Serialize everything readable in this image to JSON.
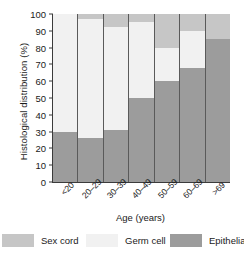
{
  "chart_data": {
    "type": "bar",
    "subtype": "stacked-bar-100",
    "title": "",
    "xlabel": "Age (years)",
    "ylabel": "Histological distribution (%)",
    "categories": [
      "<20",
      "20–29",
      "30–39",
      "40–49",
      "50–59",
      "60–69",
      ">69"
    ],
    "series": [
      {
        "name": "Sex cord",
        "color": "#c6c6c6",
        "values": [
          0,
          3,
          8,
          5,
          20,
          10,
          15
        ]
      },
      {
        "name": "Germ cell",
        "color": "#f1f1f1",
        "values": [
          70,
          71,
          61,
          45,
          20,
          22,
          0
        ]
      },
      {
        "name": "Epithelial",
        "color": "#9c9c9c",
        "values": [
          30,
          26,
          31,
          50,
          60,
          68,
          85
        ]
      }
    ],
    "stack_order_bottom_to_top": [
      "Epithelial",
      "Germ cell",
      "Sex cord"
    ],
    "ylim": [
      0,
      100
    ],
    "yticks": [
      100,
      90,
      80,
      70,
      60,
      50,
      40,
      30,
      20,
      10,
      0
    ],
    "ytick_labels": [
      "100",
      "90",
      "80",
      "70",
      "60",
      "50",
      "40",
      "30",
      "20",
      "10",
      "0"
    ],
    "grid": false,
    "legend_position": "bottom",
    "legend_entries": [
      "Sex cord",
      "Germ cell",
      "Epithelial"
    ],
    "axis_color": "#3b3b3b",
    "background": "#ffffff"
  }
}
